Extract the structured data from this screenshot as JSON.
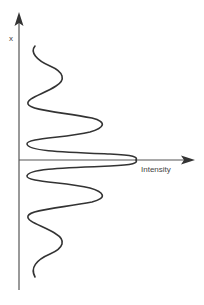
{
  "diagram": {
    "type": "intensity-profile",
    "axes": {
      "vertical": {
        "label": "x"
      },
      "horizontal": {
        "label": "Intensity"
      }
    },
    "curve": {
      "description": "Symmetric oscillating intensity profile with central maximum and decaying side lobes",
      "peaks": [
        {
          "position": "top",
          "relative_intensity": "low"
        },
        {
          "position": "upper",
          "relative_intensity": "medium"
        },
        {
          "position": "center",
          "relative_intensity": "max"
        },
        {
          "position": "lower",
          "relative_intensity": "medium"
        },
        {
          "position": "bottom",
          "relative_intensity": "low"
        }
      ]
    },
    "colors": {
      "axis": "#555555",
      "curve": "#333333",
      "background": "#ffffff"
    }
  }
}
